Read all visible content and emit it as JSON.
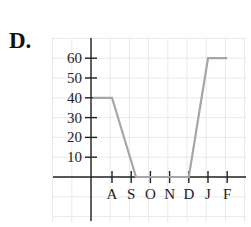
{
  "option": {
    "label": "D."
  },
  "chart_data": {
    "type": "line",
    "title": "",
    "xlabel": "",
    "ylabel": "",
    "categories": [
      "A",
      "S",
      "O",
      "N",
      "D",
      "J",
      "F"
    ],
    "x_tick_labels": [
      "A",
      "S",
      "O",
      "N",
      "D",
      "J",
      "F"
    ],
    "y_tick_labels": [
      "10",
      "20",
      "30",
      "40",
      "50",
      "60"
    ],
    "y_ticks": [
      10,
      20,
      30,
      40,
      50,
      60
    ],
    "ylim": [
      0,
      70
    ],
    "grid": true,
    "legend": null,
    "series": [
      {
        "name": "value",
        "color": "#a6a6a6",
        "points": [
          {
            "x": -1.0,
            "y": 40
          },
          {
            "x": 0,
            "y": 40
          },
          {
            "x": 1.25,
            "y": 0
          },
          {
            "x": 4.0,
            "y": 0
          },
          {
            "x": 5,
            "y": 60
          },
          {
            "x": 6,
            "y": 60
          }
        ]
      }
    ],
    "annotations": []
  },
  "colors": {
    "axis": "#222222",
    "grid": "#e4e4e4",
    "line": "#a6a6a6"
  }
}
